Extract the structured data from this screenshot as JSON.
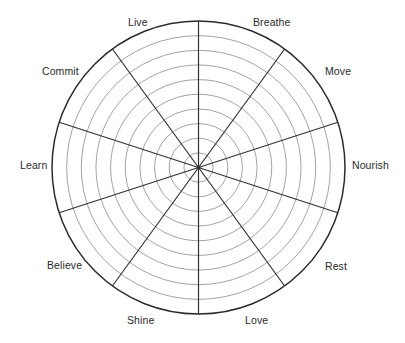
{
  "diagram": {
    "type": "wheel-of-life",
    "center": [
      198.5,
      167.5
    ],
    "outer_radius": 146.5,
    "ring_count": 10,
    "spoke_count": 10,
    "spoke_angle_step_deg": 36,
    "colors": {
      "outer_circle": "#2b2b2b",
      "spokes": "#333333",
      "rings": "#8a8a8a",
      "label": "#2a2a2a",
      "background": "#ffffff"
    },
    "segments": [
      {
        "label": "Breathe",
        "x": 253,
        "y": 17
      },
      {
        "label": "Move",
        "x": 325,
        "y": 66
      },
      {
        "label": "Nourish",
        "x": 352,
        "y": 160
      },
      {
        "label": "Rest",
        "x": 325,
        "y": 261
      },
      {
        "label": "Love",
        "x": 245,
        "y": 315
      },
      {
        "label": "Shine",
        "x": 127,
        "y": 315
      },
      {
        "label": "Believe",
        "x": 47,
        "y": 260
      },
      {
        "label": "Learn",
        "x": 20,
        "y": 160
      },
      {
        "label": "Commit",
        "x": 42,
        "y": 66
      },
      {
        "label": "Live",
        "x": 128,
        "y": 17
      }
    ]
  }
}
